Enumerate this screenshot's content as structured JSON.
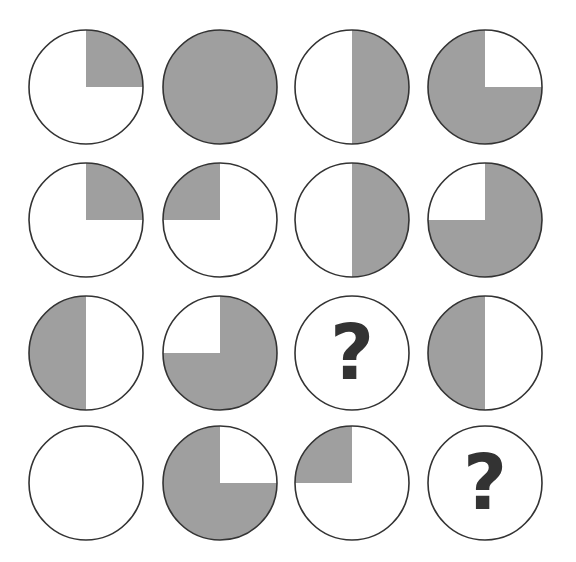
{
  "puzzle": {
    "type": "circle-pattern-matrix",
    "rows": 4,
    "cols": 4,
    "colors": {
      "fill": "#9f9f9f",
      "stroke": "#333333",
      "background": "#ffffff",
      "question": "#333333"
    },
    "cells": [
      {
        "row": 1,
        "col": 1,
        "shaded": [
          "top-right"
        ],
        "label": ""
      },
      {
        "row": 1,
        "col": 2,
        "shaded": [
          "top-left",
          "top-right",
          "bottom-left",
          "bottom-right"
        ],
        "label": ""
      },
      {
        "row": 1,
        "col": 3,
        "shaded": [
          "top-right",
          "bottom-right"
        ],
        "label": ""
      },
      {
        "row": 1,
        "col": 4,
        "shaded": [
          "top-left",
          "bottom-left",
          "bottom-right"
        ],
        "label": ""
      },
      {
        "row": 2,
        "col": 1,
        "shaded": [
          "top-right"
        ],
        "label": ""
      },
      {
        "row": 2,
        "col": 2,
        "shaded": [
          "top-left"
        ],
        "label": ""
      },
      {
        "row": 2,
        "col": 3,
        "shaded": [
          "top-right",
          "bottom-right"
        ],
        "label": ""
      },
      {
        "row": 2,
        "col": 4,
        "shaded": [
          "top-right",
          "bottom-left",
          "bottom-right"
        ],
        "label": ""
      },
      {
        "row": 3,
        "col": 1,
        "shaded": [
          "top-left",
          "bottom-left"
        ],
        "label": ""
      },
      {
        "row": 3,
        "col": 2,
        "shaded": [
          "top-right",
          "bottom-left",
          "bottom-right"
        ],
        "label": ""
      },
      {
        "row": 3,
        "col": 3,
        "shaded": [],
        "label": "?"
      },
      {
        "row": 3,
        "col": 4,
        "shaded": [
          "top-left",
          "bottom-left"
        ],
        "label": ""
      },
      {
        "row": 4,
        "col": 1,
        "shaded": [],
        "label": ""
      },
      {
        "row": 4,
        "col": 2,
        "shaded": [
          "top-left",
          "bottom-left",
          "bottom-right"
        ],
        "label": ""
      },
      {
        "row": 4,
        "col": 3,
        "shaded": [
          "top-left"
        ],
        "label": ""
      },
      {
        "row": 4,
        "col": 4,
        "shaded": [],
        "label": "?"
      }
    ]
  }
}
